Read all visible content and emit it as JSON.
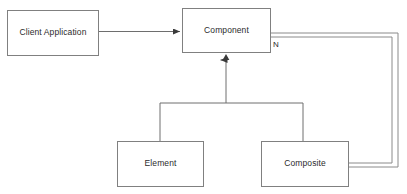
{
  "diagram": {
    "type": "uml-class-diagram",
    "background_color": "#ffffff",
    "line_color": "#808080",
    "text_color": "#2b2b2b",
    "nodes": [
      {
        "id": "client-application",
        "label": "Client Application",
        "shape": "rectangle",
        "x": 7,
        "y": 10,
        "width": 92,
        "height": 46
      },
      {
        "id": "component",
        "label": "Component",
        "shape": "rectangle",
        "x": 182,
        "y": 8,
        "width": 89,
        "height": 45
      },
      {
        "id": "element",
        "label": "Element",
        "shape": "rectangle",
        "x": 117,
        "y": 141,
        "width": 87,
        "height": 46
      },
      {
        "id": "composite",
        "label": "Composite",
        "shape": "rectangle",
        "x": 261,
        "y": 141,
        "width": 88,
        "height": 46
      }
    ],
    "edges": [
      {
        "id": "client-to-component",
        "from": "client-application",
        "to": "component",
        "style": "solid",
        "arrowhead": "filled-triangle",
        "label": ""
      },
      {
        "id": "element-to-component",
        "from": "element",
        "to": "component",
        "style": "solid-inheritance",
        "arrowhead": "filled-triangle",
        "label": ""
      },
      {
        "id": "composite-to-component",
        "from": "composite",
        "to": "component",
        "style": "solid-inheritance",
        "arrowhead": "filled-triangle",
        "label": ""
      },
      {
        "id": "component-to-composite-aggregation",
        "from": "component",
        "to": "composite",
        "style": "double-line",
        "arrowhead": "none",
        "label": "N"
      }
    ],
    "labels": {
      "multiplicity_n": "N"
    }
  }
}
